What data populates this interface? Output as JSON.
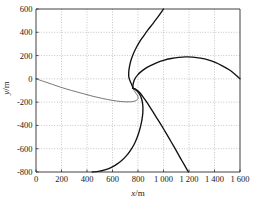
{
  "chart_data": {
    "type": "line",
    "title": "",
    "xlabel": "x/m",
    "ylabel": "y/m",
    "xlim": [
      0,
      1600
    ],
    "ylim": [
      -800,
      600
    ],
    "grid": true,
    "legend": "none",
    "xticks": [
      0,
      200,
      400,
      600,
      800,
      1000,
      1200,
      1400,
      1600
    ],
    "xtick_labels": [
      "0",
      "200",
      "400",
      "600",
      "800",
      "1 000",
      "1 200",
      "1 400",
      "1 600"
    ],
    "yticks": [
      -800,
      -600,
      -400,
      -200,
      0,
      200,
      400,
      600
    ],
    "ytick_labels": [
      "-800",
      "-600",
      "-400",
      "-200",
      "0",
      "200",
      "400",
      "600"
    ],
    "convergence_point": [
      760,
      -80
    ],
    "series": [
      {
        "name": "trajectory-1",
        "stroke": "#3d3d3d",
        "width": "thin",
        "points": [
          [
            0,
            0
          ],
          [
            60,
            -22
          ],
          [
            130,
            -48
          ],
          [
            200,
            -74
          ],
          [
            280,
            -100
          ],
          [
            360,
            -124
          ],
          [
            440,
            -148
          ],
          [
            520,
            -168
          ],
          [
            600,
            -185
          ],
          [
            660,
            -194
          ],
          [
            700,
            -197
          ],
          [
            740,
            -197
          ],
          [
            770,
            -192
          ],
          [
            790,
            -182
          ],
          [
            800,
            -170
          ],
          [
            800,
            -155
          ],
          [
            793,
            -138
          ],
          [
            782,
            -120
          ],
          [
            770,
            -100
          ],
          [
            762,
            -86
          ],
          [
            760,
            -80
          ]
        ]
      },
      {
        "name": "trajectory-2",
        "stroke": "#121212",
        "width": "thick",
        "points": [
          [
            1000,
            600
          ],
          [
            975,
            560
          ],
          [
            945,
            515
          ],
          [
            912,
            468
          ],
          [
            878,
            420
          ],
          [
            845,
            370
          ],
          [
            812,
            318
          ],
          [
            785,
            265
          ],
          [
            762,
            212
          ],
          [
            745,
            160
          ],
          [
            734,
            110
          ],
          [
            728,
            66
          ],
          [
            727,
            30
          ],
          [
            731,
            2
          ],
          [
            740,
            -24
          ],
          [
            750,
            -48
          ],
          [
            757,
            -66
          ],
          [
            760,
            -80
          ]
        ]
      },
      {
        "name": "trajectory-3",
        "stroke": "#121212",
        "width": "thick",
        "points": [
          [
            1600,
            0
          ],
          [
            1560,
            40
          ],
          [
            1515,
            78
          ],
          [
            1465,
            110
          ],
          [
            1410,
            140
          ],
          [
            1350,
            163
          ],
          [
            1290,
            178
          ],
          [
            1230,
            187
          ],
          [
            1175,
            189
          ],
          [
            1120,
            185
          ],
          [
            1060,
            175
          ],
          [
            1000,
            159
          ],
          [
            945,
            138
          ],
          [
            898,
            114
          ],
          [
            856,
            88
          ],
          [
            822,
            60
          ],
          [
            796,
            32
          ],
          [
            778,
            5
          ],
          [
            767,
            -22
          ],
          [
            761,
            -50
          ],
          [
            760,
            -68
          ],
          [
            760,
            -80
          ]
        ]
      },
      {
        "name": "trajectory-4",
        "stroke": "#121212",
        "width": "thick",
        "points": [
          [
            1195,
            -800
          ],
          [
            1168,
            -748
          ],
          [
            1140,
            -695
          ],
          [
            1112,
            -640
          ],
          [
            1082,
            -582
          ],
          [
            1050,
            -522
          ],
          [
            1018,
            -462
          ],
          [
            985,
            -402
          ],
          [
            952,
            -344
          ],
          [
            920,
            -288
          ],
          [
            890,
            -236
          ],
          [
            862,
            -190
          ],
          [
            838,
            -152
          ],
          [
            816,
            -122
          ],
          [
            798,
            -102
          ],
          [
            782,
            -90
          ],
          [
            770,
            -84
          ],
          [
            760,
            -80
          ]
        ]
      },
      {
        "name": "trajectory-5",
        "stroke": "#121212",
        "width": "thick",
        "points": [
          [
            440,
            -800
          ],
          [
            490,
            -795
          ],
          [
            540,
            -782
          ],
          [
            588,
            -762
          ],
          [
            632,
            -735
          ],
          [
            672,
            -702
          ],
          [
            708,
            -662
          ],
          [
            740,
            -616
          ],
          [
            768,
            -566
          ],
          [
            790,
            -512
          ],
          [
            808,
            -456
          ],
          [
            822,
            -400
          ],
          [
            832,
            -344
          ],
          [
            838,
            -288
          ],
          [
            838,
            -235
          ],
          [
            832,
            -188
          ],
          [
            820,
            -148
          ],
          [
            802,
            -116
          ],
          [
            784,
            -96
          ],
          [
            770,
            -85
          ],
          [
            760,
            -80
          ]
        ]
      }
    ]
  }
}
